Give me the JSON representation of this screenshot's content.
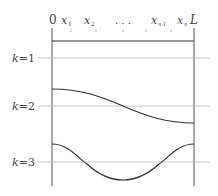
{
  "diagram": {
    "top_labels": {
      "zero": "0",
      "x1": "x",
      "x1_sub": "1",
      "x2": "x",
      "x2_sub": "2",
      "dots": ". . .",
      "xn1": "x",
      "xn1_sub": "n-1",
      "xn": "x",
      "xn_sub": "n",
      "L": "L"
    },
    "modes": [
      {
        "k": "k",
        "eq": "=1"
      },
      {
        "k": "k",
        "eq": "=2"
      },
      {
        "k": "k",
        "eq": "=3"
      }
    ],
    "colors": {
      "curve": "#333333",
      "axis": "#555555",
      "baseline": "#bbbbbb"
    }
  }
}
